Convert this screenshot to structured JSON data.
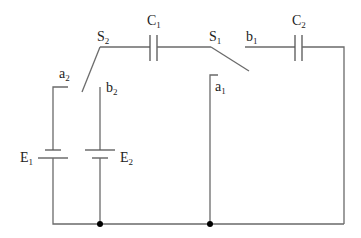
{
  "diagram": {
    "type": "circuit",
    "colors": {
      "wire": "#6a6a6a",
      "node": "#000000",
      "background": "#ffffff"
    },
    "labels": {
      "S2": {
        "main": "S",
        "sub": "2"
      },
      "C1": {
        "main": "C",
        "sub": "1"
      },
      "S1": {
        "main": "S",
        "sub": "1"
      },
      "b1": {
        "main": "b",
        "sub": "1"
      },
      "C2": {
        "main": "C",
        "sub": "2"
      },
      "a2": {
        "main": "a",
        "sub": "2"
      },
      "b2": {
        "main": "b",
        "sub": "2"
      },
      "a1": {
        "main": "a",
        "sub": "1"
      },
      "E1": {
        "main": "E",
        "sub": "1"
      },
      "E2": {
        "main": "E",
        "sub": "2"
      }
    },
    "components": [
      {
        "id": "E1",
        "kind": "battery"
      },
      {
        "id": "E2",
        "kind": "battery"
      },
      {
        "id": "C1",
        "kind": "capacitor"
      },
      {
        "id": "C2",
        "kind": "capacitor"
      },
      {
        "id": "S1",
        "kind": "switch",
        "terminals": [
          "a1",
          "b1"
        ]
      },
      {
        "id": "S2",
        "kind": "switch",
        "terminals": [
          "a2",
          "b2"
        ]
      }
    ]
  }
}
